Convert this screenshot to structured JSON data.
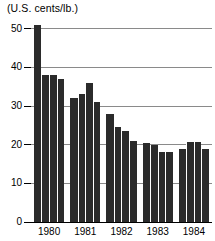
{
  "chart_data": {
    "type": "bar",
    "title": "",
    "ylabel": "(U.S. cents/lb.)",
    "xlabel": "",
    "ylim": [
      0,
      52
    ],
    "yticks": [
      0,
      10,
      20,
      30,
      40,
      50
    ],
    "ytick_labels": [
      "0",
      "10",
      "20",
      "30",
      "40",
      "50"
    ],
    "grid": true,
    "legend": false,
    "categories": [
      "1980",
      "1981",
      "1982",
      "1983",
      "1984"
    ],
    "bars_per_category": 4,
    "values": [
      [
        51,
        38,
        38,
        37
      ],
      [
        32,
        33,
        36,
        31
      ],
      [
        28,
        24.5,
        23.5,
        21
      ],
      [
        20.5,
        20,
        18,
        18
      ],
      [
        19,
        20.8,
        20.8,
        19
      ]
    ],
    "bar_color": "#2b2b2b",
    "gridline_color": "#8a8a8a",
    "axis_color": "#000000",
    "background_color": "#ffffff"
  },
  "caption": {
    "unit_label": "(U.S. cents/lb.)"
  }
}
